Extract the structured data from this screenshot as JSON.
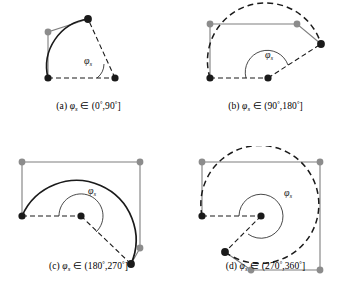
{
  "figure": {
    "background": "#ffffff",
    "width": 354,
    "height": 292
  },
  "style": {
    "black": "#1a1a1a",
    "gray": "#8c8c8c",
    "line_gray": "#7f7f7f",
    "dash_pattern": "5,3",
    "marker_radius_black": 3.6,
    "marker_radius_gray": 3.4
  },
  "symbols": {
    "phi": "φ",
    "subscript": "s",
    "degree": "°",
    "element_of": "∈"
  },
  "panels": [
    {
      "id": "a",
      "label": "(a)",
      "angle_symbol": "φ",
      "angle_subscript": "s",
      "range_open": "(",
      "range_low": "0",
      "range_high": "90",
      "range_close": "]",
      "caption_text": "(a) φs ∈ (0°,90°]",
      "arc_style": "solid",
      "angle_label": "φ",
      "angle_label_sub": "s",
      "sweep_degrees": 72,
      "description": "Arc sweeping less than 90 degrees, solid curve, two gray corner markers"
    },
    {
      "id": "b",
      "label": "(b)",
      "angle_symbol": "φ",
      "angle_subscript": "s",
      "range_open": "(",
      "range_low": "90",
      "range_high": "180",
      "range_close": "]",
      "caption_text": "(b) φs ∈ (90°,180°]",
      "arc_style": "dashed",
      "angle_label": "φ",
      "angle_label_sub": "s",
      "sweep_degrees": 160,
      "description": "Dashed arc sweeping between 90 and 180 degrees"
    },
    {
      "id": "c",
      "label": "(c)",
      "angle_symbol": "φ",
      "angle_subscript": "s",
      "range_open": "(",
      "range_low": "180",
      "range_high": "270",
      "range_close": "]",
      "caption_text": "(c) φs ∈ (180°,270°]",
      "arc_style": "solid",
      "angle_label": "φ",
      "angle_label_sub": "s",
      "sweep_degrees": 250,
      "description": "Solid arc sweeping between 180 and 270 degrees"
    },
    {
      "id": "d",
      "label": "(d)",
      "angle_symbol": "φ",
      "angle_subscript": "s",
      "range_open": "(",
      "range_low": "270",
      "range_high": "360",
      "range_close": "]",
      "caption_text": "(d) φs ∈ (270°,360°]",
      "arc_style": "dashed",
      "angle_label": "φ",
      "angle_label_sub": "s",
      "sweep_degrees": 325,
      "description": "Dashed near-full circle sweeping between 270 and 360 degrees"
    }
  ]
}
